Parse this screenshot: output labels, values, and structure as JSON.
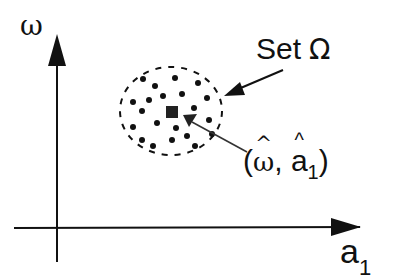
{
  "diagram": {
    "y_axis_label": "ω",
    "x_axis_label_base": "a",
    "x_axis_label_sub": "1",
    "set_label_text": "Set",
    "set_label_symbol": "Ω",
    "point_label": {
      "open": "(",
      "omega": "ω",
      "comma": ",",
      "a": "a",
      "sub": "1",
      "close": ")"
    },
    "set_point_count": 21,
    "colors": {
      "ink": "#111111",
      "pointer": "#333333",
      "background": "#ffffff"
    }
  }
}
